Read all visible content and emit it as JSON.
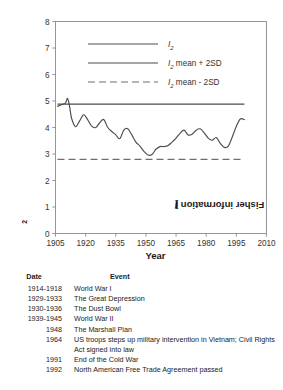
{
  "chart_data": {
    "type": "line",
    "title": "",
    "xlabel": "Year",
    "ylabel": "Fisher information (I2)",
    "ylabel_base": "Fisher information (",
    "ylabel_sym": "I",
    "ylabel_sub": "2",
    "ylabel_end": ")",
    "xlim": [
      1905,
      2010
    ],
    "ylim": [
      0,
      8
    ],
    "xticks": [
      1905,
      1920,
      1935,
      1950,
      1965,
      1980,
      1995,
      2010
    ],
    "yticks": [
      0,
      1,
      2,
      3,
      4,
      5,
      6,
      7,
      8
    ],
    "grid": false,
    "legend_position": "upper-center",
    "legend": [
      {
        "label": "I2",
        "style": "solid",
        "symbol": "I",
        "sub": "2",
        "rest": ""
      },
      {
        "label": "I2 mean + 2SD",
        "style": "solid",
        "symbol": "I",
        "sub": "2",
        "rest": " mean + 2SD"
      },
      {
        "label": "I2 mean - 2SD",
        "style": "dashed",
        "symbol": "I",
        "sub": "2",
        "rest": " mean - 2SD"
      }
    ],
    "series": [
      {
        "name": "I2",
        "style": "solid",
        "color": "#4d4d4d",
        "x": [
          1906,
          1908,
          1910,
          1911,
          1912,
          1913,
          1915,
          1917,
          1919,
          1921,
          1923,
          1925,
          1927,
          1929,
          1931,
          1933,
          1935,
          1937,
          1939,
          1941,
          1943,
          1945,
          1947,
          1949,
          1951,
          1953,
          1955,
          1957,
          1959,
          1961,
          1963,
          1965,
          1967,
          1969,
          1971,
          1973,
          1975,
          1977,
          1979,
          1981,
          1983,
          1985,
          1987,
          1989,
          1991,
          1993,
          1995,
          1997,
          1999
        ],
        "y": [
          4.8,
          4.86,
          4.93,
          5.1,
          4.8,
          4.35,
          4.03,
          4.25,
          4.48,
          4.3,
          4.05,
          4.0,
          4.18,
          4.3,
          4.0,
          3.85,
          3.72,
          3.58,
          3.9,
          3.95,
          3.72,
          3.45,
          3.3,
          3.1,
          2.96,
          2.98,
          3.18,
          3.28,
          3.28,
          3.32,
          3.45,
          3.6,
          3.78,
          3.9,
          3.72,
          3.75,
          3.9,
          3.95,
          3.8,
          3.6,
          3.52,
          3.62,
          3.4,
          3.25,
          3.3,
          3.65,
          4.05,
          4.32,
          4.3
        ]
      },
      {
        "name": "I2 mean + 2SD",
        "style": "solid",
        "color": "#4d4d4d",
        "value": 4.88,
        "x_range": [
          1906,
          1999
        ]
      },
      {
        "name": "I2 mean - 2SD",
        "style": "dashed",
        "color": "#6e6e6e",
        "value": 2.8,
        "x_range": [
          1906,
          1999
        ]
      }
    ]
  },
  "table": {
    "headers": {
      "date": "Date",
      "event": "Event"
    },
    "rows": [
      {
        "date": "1914-1918",
        "event": "World War I"
      },
      {
        "date": "1929-1933",
        "event": "The Great Depression"
      },
      {
        "date": "1930-1936",
        "event": "The Dust Bowl"
      },
      {
        "date": "1939-1945",
        "event": "World War II"
      },
      {
        "date": "1948",
        "event": "The Marshall Plan"
      },
      {
        "date": "1964",
        "event": "US troops steps up military intervention in Vietnam; Civil Rights Act signed into law"
      },
      {
        "date": "1991",
        "event": "End of the Cold War"
      },
      {
        "date": "1992",
        "event": "North American Free Trade Agreement passed"
      }
    ]
  }
}
